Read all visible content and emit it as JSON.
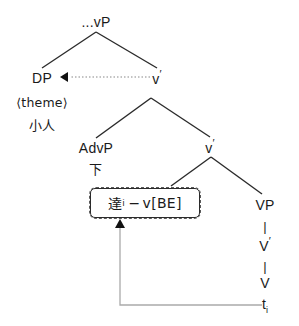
{
  "diagram": {
    "type": "syntax-tree",
    "canvas": {
      "width": 299,
      "height": 326,
      "background": "#ffffff"
    },
    "colors": {
      "line": "#2b2b2b",
      "text": "#1a1a1a",
      "dashed_box_border": "#5a5a5a",
      "solid_box_border": "#2b2b2b",
      "movement_arrow": "#9a9a9a",
      "arrowhead": "#111111"
    },
    "nodes": {
      "root": {
        "label": "...vP",
        "x": 96,
        "y": 22
      },
      "dp": {
        "label": "DP",
        "x": 42,
        "y": 78
      },
      "dp_theme": {
        "label": "⟨theme⟩",
        "x": 42,
        "y": 103
      },
      "dp_word": {
        "label": "小人",
        "x": 42,
        "y": 126
      },
      "vbar1": {
        "label": "v",
        "prime": "′",
        "x": 157,
        "y": 78
      },
      "advp": {
        "label": "AdvP",
        "x": 96,
        "y": 148
      },
      "advp_word": {
        "label": "下",
        "x": 96,
        "y": 170
      },
      "vbar2": {
        "label": "v",
        "prime": "′",
        "x": 210,
        "y": 147
      },
      "boxed": {
        "word": "達",
        "subscript": "i",
        "separator": "−",
        "light_verb": "v[BE]",
        "full_label": "達ᵢ − v[BE]",
        "x": 145,
        "y": 203,
        "width": 112,
        "height": 32
      },
      "vp": {
        "label": "VP",
        "x": 265,
        "y": 205
      },
      "vp_bar1": {
        "label": "|",
        "x": 265,
        "y": 226
      },
      "vbar3": {
        "label": "V",
        "prime": "′",
        "x": 265,
        "y": 245
      },
      "vp_bar2": {
        "label": "|",
        "x": 265,
        "y": 265
      },
      "v_head": {
        "label": "V",
        "x": 265,
        "y": 283
      },
      "trace": {
        "label": "t",
        "subscript": "i",
        "x": 265,
        "y": 306
      }
    },
    "branches": [
      {
        "name": "root-to-dp",
        "x1": 96,
        "y1": 32,
        "x2": 42,
        "y2": 68
      },
      {
        "name": "root-to-vbar1",
        "x1": 96,
        "y1": 32,
        "x2": 157,
        "y2": 68
      },
      {
        "name": "vbar1-to-advp",
        "x1": 151,
        "y1": 98,
        "x2": 96,
        "y2": 138
      },
      {
        "name": "vbar1-to-vbar2",
        "x1": 151,
        "y1": 98,
        "x2": 210,
        "y2": 137
      },
      {
        "name": "vbar2-to-boxed",
        "x1": 211,
        "y1": 157,
        "x2": 170,
        "y2": 186
      },
      {
        "name": "vbar2-to-vp",
        "x1": 211,
        "y1": 157,
        "x2": 262,
        "y2": 194
      }
    ],
    "arrows": [
      {
        "name": "theme-movement-arrow",
        "style": "dotted",
        "from": {
          "x": 150,
          "y": 77
        },
        "to": {
          "x": 62,
          "y": 77
        },
        "head": "left"
      },
      {
        "name": "head-movement-arrow",
        "style": "solid-light",
        "path": "t_i -> up -> boxed light verb",
        "from": {
          "x": 262,
          "y": 305
        },
        "corner": {
          "x": 120,
          "y": 305
        },
        "to": {
          "x": 120,
          "y": 222
        },
        "head": "up"
      }
    ]
  }
}
